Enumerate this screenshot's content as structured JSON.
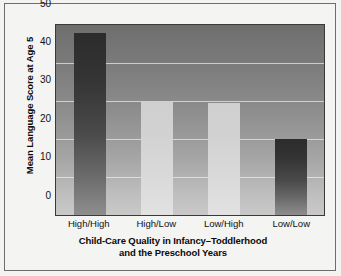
{
  "chart_data": {
    "type": "bar",
    "title": "",
    "xlabel": "Child-Care Quality in Infancy–Toddlerhood and the Preschool Years",
    "xlabel_line1": "Child-Care Quality in Infancy–Toddlerhood",
    "xlabel_line2": "and the Preschool Years",
    "ylabel": "Mean Language Score at Age 5",
    "categories": [
      "High/High",
      "High/Low",
      "Low/High",
      "Low/Low"
    ],
    "values": [
      48,
      30,
      29.5,
      20
    ],
    "ylim": [
      0,
      50
    ],
    "yticks": [
      "0",
      "10",
      "20",
      "30",
      "40",
      "50"
    ],
    "ytick_values": [
      0,
      10,
      20,
      30,
      40,
      50
    ],
    "grid": true,
    "legend": "none",
    "bar_shades": [
      "dark",
      "light",
      "light",
      "dark"
    ],
    "colors": {
      "bar_dark": "#343434",
      "bar_light": "#d6d6d6",
      "plot_background_top": "#6e6e6e",
      "plot_background_bottom": "#c9c9c9",
      "gridline": "#ebebeb",
      "axis": "#3a3a3a",
      "text": "#0a0a0a",
      "frame": "#6d6d6d",
      "page_background": "#f4f4f2"
    }
  }
}
